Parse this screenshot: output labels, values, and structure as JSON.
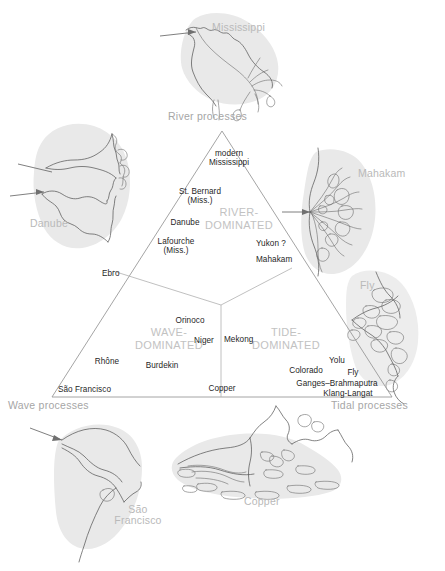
{
  "figure": {
    "background_color": "#ffffff",
    "line_color": "#9a9a9a",
    "field_label_color": "#c2c2c2",
    "delta_name_color": "#b9b9b9",
    "river_label_color": "#1f1f1f"
  },
  "corners": {
    "top": "River processes",
    "bottom_left": "Wave processes",
    "bottom_right": "Tidal processes"
  },
  "fields": [
    {
      "id": "river",
      "line1": "RIVER-",
      "line2": "DOMINATED"
    },
    {
      "id": "wave",
      "line1": "WAVE-",
      "line2": "DOMINATED"
    },
    {
      "id": "tide",
      "line1": "TIDE-",
      "line2": "DOMINATED"
    }
  ],
  "plotted_deltas": {
    "river_field": [
      {
        "label": "modern\nMississippi",
        "line1": "modern",
        "line2": "Mississippi"
      },
      {
        "label": "St. Bernard\n(Miss.)",
        "line1": "St. Bernard",
        "line2": "(Miss.)"
      },
      {
        "label": "Danube",
        "line1": "Danube",
        "line2": ""
      },
      {
        "label": "Lafourche\n(Miss.)",
        "line1": "Lafourche",
        "line2": "(Miss.)"
      },
      {
        "label": "Yukon ?",
        "line1": "Yukon ?",
        "line2": ""
      },
      {
        "label": "Mahakam",
        "line1": "Mahakam",
        "line2": ""
      }
    ],
    "boundary": [
      {
        "label": "Ebro"
      },
      {
        "label": "Mekong"
      },
      {
        "label": "Copper"
      }
    ],
    "wave_field": [
      {
        "label": "Orinoco"
      },
      {
        "label": "Niger"
      },
      {
        "label": "Burdekin"
      },
      {
        "label": "Rhône"
      },
      {
        "label": "São Francisco"
      }
    ],
    "tide_field": [
      {
        "label": "Yolu"
      },
      {
        "label": "Fly"
      },
      {
        "label": "Colorado"
      },
      {
        "label": "Ganges–Brahmaputra"
      },
      {
        "label": "Klang-Langat"
      }
    ]
  },
  "delta_maps": [
    {
      "id": "mississippi",
      "name": "Mississippi",
      "position": "top"
    },
    {
      "id": "danube",
      "name": "Danube",
      "position": "upper-left"
    },
    {
      "id": "mahakam",
      "name": "Mahakam",
      "position": "upper-right"
    },
    {
      "id": "fly",
      "name": "Fly",
      "position": "right"
    },
    {
      "id": "sao-francisco",
      "name_line1": "São",
      "name_line2": "Francisco",
      "position": "bottom-left"
    },
    {
      "id": "copper",
      "name": "Copper",
      "position": "bottom-center"
    }
  ]
}
